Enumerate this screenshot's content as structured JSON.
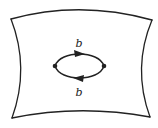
{
  "diagram": {
    "type": "surface-with-loop",
    "colors": {
      "background": "#ffffff",
      "stroke": "#222222"
    },
    "surface": {
      "corners": {
        "top_left": [
          11,
          19
        ],
        "top_right": [
          152,
          20
        ],
        "bottom_right": [
          150,
          117
        ],
        "bottom_left": [
          12,
          118
        ]
      }
    },
    "vertices": [
      {
        "id": "left",
        "x": 55,
        "y": 66
      },
      {
        "id": "right",
        "x": 104,
        "y": 66
      }
    ],
    "edges": [
      {
        "id": "top-edge",
        "from": "left",
        "to": "right",
        "label": "b",
        "arrow_direction": "right"
      },
      {
        "id": "bottom-edge",
        "from": "right",
        "to": "left",
        "label": "b",
        "arrow_direction": "left"
      }
    ],
    "labels": {
      "top": "b",
      "bottom": "b"
    }
  }
}
